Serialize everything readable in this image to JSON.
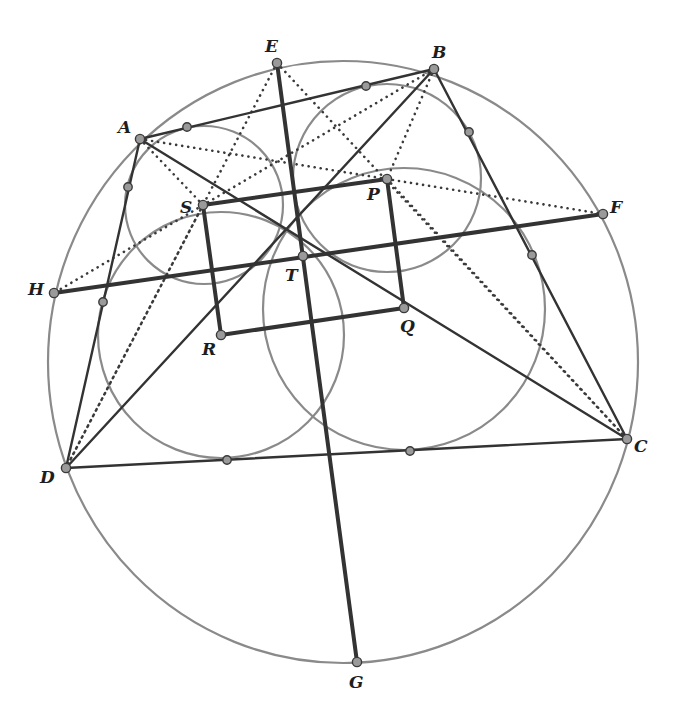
{
  "diagram": {
    "title": "",
    "points": {
      "A": {
        "label": "A"
      },
      "B": {
        "label": "B"
      },
      "C": {
        "label": "C"
      },
      "D": {
        "label": "D"
      },
      "E": {
        "label": "E"
      },
      "F": {
        "label": "F"
      },
      "G": {
        "label": "G"
      },
      "H": {
        "label": "H"
      },
      "P": {
        "label": "P"
      },
      "Q": {
        "label": "Q"
      },
      "R": {
        "label": "R"
      },
      "S": {
        "label": "S"
      },
      "T": {
        "label": "T"
      }
    },
    "circumcircle": {
      "through": [
        "A",
        "E",
        "B",
        "F",
        "C",
        "G",
        "D",
        "H"
      ]
    },
    "incircles": [
      {
        "name": "incircle-ABD",
        "center": "S"
      },
      {
        "name": "incircle-ABC",
        "center": "P"
      },
      {
        "name": "incircle-BCD",
        "center": "Q"
      },
      {
        "name": "incircle-ACD",
        "center": "R"
      }
    ],
    "solid_segments": [
      [
        "A",
        "B"
      ],
      [
        "B",
        "C"
      ],
      [
        "C",
        "D"
      ],
      [
        "D",
        "A"
      ],
      [
        "A",
        "C"
      ],
      [
        "B",
        "D"
      ]
    ],
    "bold_segments": [
      [
        "P",
        "Q"
      ],
      [
        "Q",
        "R"
      ],
      [
        "R",
        "S"
      ],
      [
        "S",
        "P"
      ],
      [
        "E",
        "G"
      ],
      [
        "H",
        "F"
      ]
    ],
    "dotted_segments": [
      [
        "E",
        "D"
      ],
      [
        "E",
        "C"
      ],
      [
        "A",
        "S"
      ],
      [
        "A",
        "F"
      ],
      [
        "B",
        "H"
      ],
      [
        "B",
        "P"
      ],
      [
        "P",
        "C"
      ],
      [
        "S",
        "D"
      ]
    ],
    "tangent_points_count": 8,
    "colors": {
      "circle": "#8a8a8a",
      "line": "#333333",
      "point_fill": "#9a9a9a",
      "label": "#1e1e1e"
    }
  }
}
